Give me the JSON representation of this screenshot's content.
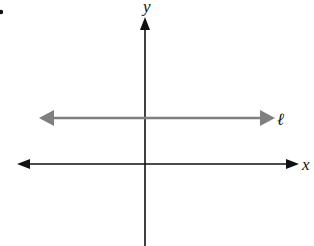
{
  "diagram": {
    "type": "coordinate-plane",
    "colors": {
      "axes": "#111111",
      "line_l": "#7f7f7f",
      "background": "#ffffff"
    },
    "labels": {
      "y_axis": "y",
      "x_axis": "x",
      "line": "ℓ"
    },
    "elements": [
      {
        "name": "y-axis",
        "orientation": "vertical",
        "arrow": "top"
      },
      {
        "name": "x-axis",
        "orientation": "horizontal",
        "arrow": "both"
      },
      {
        "name": "line-l",
        "orientation": "horizontal",
        "arrow": "both",
        "relation": "parallel to x-axis, above it"
      }
    ],
    "marker": "•"
  }
}
